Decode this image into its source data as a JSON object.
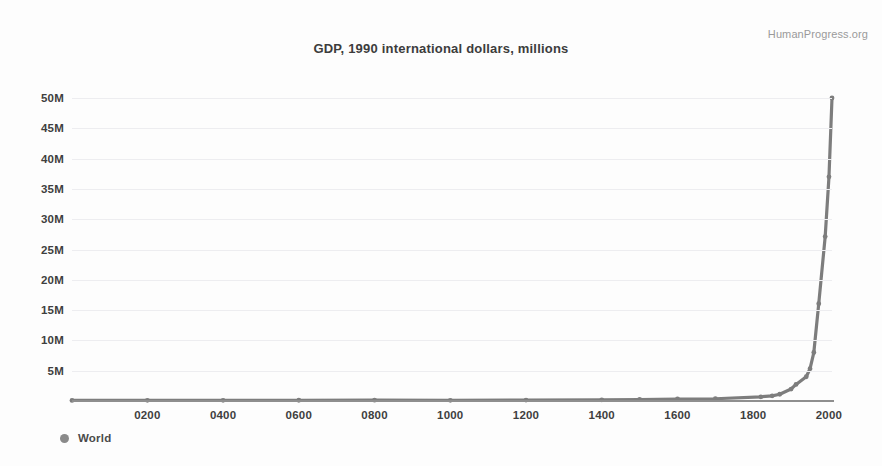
{
  "watermark": "HumanProgress.org",
  "legend": {
    "entries": [
      {
        "label": "World",
        "color": "#8a8a8a",
        "marker": "circle-marker"
      }
    ]
  },
  "chart_data": {
    "type": "line",
    "title": "GDP, 1990 international dollars, millions",
    "xlabel": "",
    "ylabel": "",
    "grid": true,
    "legend_position": "bottom-left",
    "xlim": [
      1,
      2008
    ],
    "ylim": [
      0,
      50000000
    ],
    "xticks": [
      "0200",
      "0400",
      "0600",
      "0800",
      "1000",
      "1200",
      "1400",
      "1600",
      "1800",
      "2000"
    ],
    "xtick_values": [
      200,
      400,
      600,
      800,
      1000,
      1200,
      1400,
      1600,
      1800,
      2000
    ],
    "yticks": [
      "5M",
      "10M",
      "15M",
      "20M",
      "25M",
      "30M",
      "35M",
      "40M",
      "45M",
      "50M"
    ],
    "ytick_values": [
      5000000,
      10000000,
      15000000,
      20000000,
      25000000,
      30000000,
      35000000,
      40000000,
      45000000,
      50000000
    ],
    "series": [
      {
        "name": "World",
        "color": "#7d7d7d",
        "marker": "circle",
        "x": [
          1,
          200,
          400,
          600,
          800,
          1000,
          1200,
          1400,
          1500,
          1600,
          1700,
          1820,
          1850,
          1870,
          1900,
          1913,
          1940,
          1950,
          1960,
          1973,
          1990,
          2000,
          2008
        ],
        "values": [
          102536,
          115000,
          110000,
          120000,
          135000,
          116790,
          160000,
          200000,
          248321,
          330000,
          371369,
          694442,
          850000,
          1111968,
          1973000,
          2733366,
          4000000,
          5329719,
          8000000,
          16059180,
          27132000,
          37000000,
          50000000
        ]
      }
    ]
  }
}
